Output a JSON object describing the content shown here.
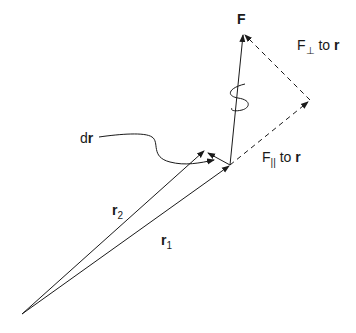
{
  "diagram": {
    "labels": {
      "force": "F",
      "perp_prefix": "F",
      "perp_symbol": "⊥",
      "perp_suffix": " to ",
      "perp_vec": "r",
      "par_prefix": "F",
      "par_symbol": "||",
      "par_suffix": " to ",
      "par_vec": "r",
      "dr_prefix": "d",
      "dr_vec": "r",
      "r2_vec": "r",
      "r2_sub": "2",
      "r1_vec": "r",
      "r1_sub": "1"
    },
    "points": {
      "origin": [
        22,
        314
      ],
      "r1_tip": [
        230,
        165
      ],
      "r2_tip": [
        204,
        150
      ],
      "force_tip": [
        243,
        33
      ],
      "perp_corner": [
        310,
        100
      ]
    },
    "colors": {
      "line": "#1a1a1a",
      "background": "#ffffff"
    }
  }
}
